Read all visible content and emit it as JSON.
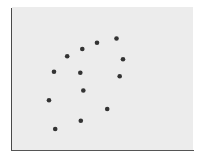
{
  "chart_data": {
    "type": "scatter",
    "title": "",
    "xlabel": "",
    "ylabel": "",
    "grid": false,
    "legend": null,
    "marker_color": "#333333",
    "plot_background": "#ececec",
    "axis_color": "#4a4a4a",
    "x": [
      116.5,
      97,
      82.3,
      67.2,
      123,
      54,
      80.3,
      119.7,
      83.3,
      49,
      107.2,
      80.8,
      55.2
    ],
    "y": [
      38.5,
      42.7,
      49,
      56.3,
      59.3,
      71.7,
      72.7,
      76.3,
      90.5,
      100.3,
      109,
      120.7,
      129
    ],
    "points_pixel_note": "coordinates in screen pixels (origin top-left), no axis ticks shown",
    "xlim": [
      11,
      193
    ],
    "ylim": [
      150,
      7
    ]
  }
}
